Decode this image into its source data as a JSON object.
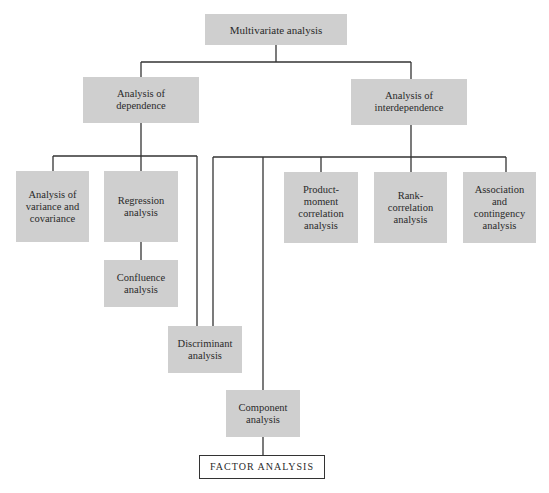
{
  "diagram": {
    "root": {
      "label": "Multivariate analysis"
    },
    "dependence": {
      "label": "Analysis of\ndependence"
    },
    "interdependence": {
      "label": "Analysis of\ninterdependence"
    },
    "anova": {
      "label": "Analysis of\nvariance and\ncovariance"
    },
    "regression": {
      "label": "Regression\nanalysis"
    },
    "confluence": {
      "label": "Confluence\nanalysis"
    },
    "discriminant": {
      "label": "Discriminant\nanalysis"
    },
    "product_moment": {
      "label": "Product-\nmoment\ncorrelation\nanalysis"
    },
    "rank": {
      "label": "Rank-\ncorrelation\nanalysis"
    },
    "association": {
      "label": "Association\nand\ncontingency\nanalysis"
    },
    "component": {
      "label": "Component\nanalysis"
    },
    "factor": {
      "label": "FACTOR ANALYSIS"
    }
  },
  "colors": {
    "box_fill": "#cfcfcf",
    "line": "#333333"
  }
}
